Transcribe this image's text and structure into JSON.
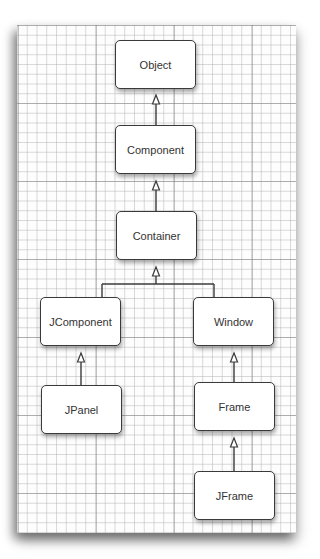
{
  "diagram": {
    "type": "class-hierarchy",
    "nodes": [
      {
        "id": "object",
        "label": "Object"
      },
      {
        "id": "component",
        "label": "Component"
      },
      {
        "id": "container",
        "label": "Container"
      },
      {
        "id": "jcomponent",
        "label": "JComponent"
      },
      {
        "id": "window",
        "label": "Window"
      },
      {
        "id": "jpanel",
        "label": "JPanel"
      },
      {
        "id": "frame",
        "label": "Frame"
      },
      {
        "id": "jframe",
        "label": "JFrame"
      }
    ],
    "edges": [
      {
        "from": "component",
        "to": "object",
        "style": "inheritance"
      },
      {
        "from": "container",
        "to": "component",
        "style": "inheritance"
      },
      {
        "from": "jcomponent",
        "to": "container",
        "style": "inheritance"
      },
      {
        "from": "window",
        "to": "container",
        "style": "inheritance"
      },
      {
        "from": "jpanel",
        "to": "jcomponent",
        "style": "inheritance"
      },
      {
        "from": "frame",
        "to": "window",
        "style": "inheritance"
      },
      {
        "from": "jframe",
        "to": "frame",
        "style": "inheritance"
      }
    ]
  },
  "colors": {
    "line": "#3a3a3a",
    "box_fill": "#ffffff",
    "grid": "#aaaaaa"
  }
}
